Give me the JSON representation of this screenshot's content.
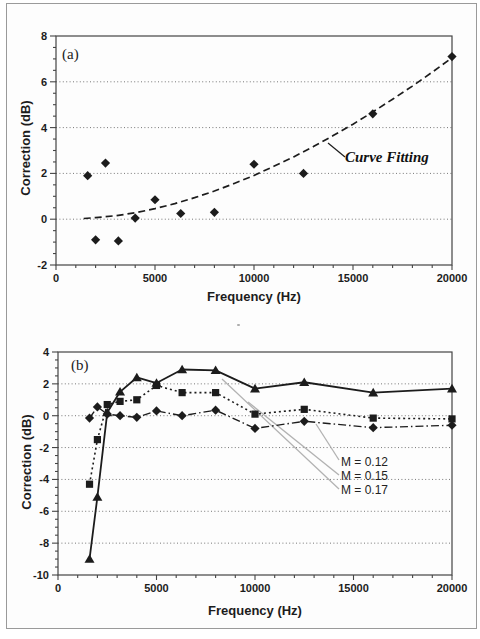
{
  "figure": {
    "panel_a_label": "(a)",
    "panel_b_label": "(b)"
  },
  "charts": [
    {
      "id": "chart-a",
      "type": "scatter",
      "panel_label": "(a)",
      "xlabel": "Frequency (Hz)",
      "ylabel": "Correction (dB)",
      "xlim": [
        0,
        20000
      ],
      "ylim": [
        -2,
        8
      ],
      "x_ticks": [
        0,
        5000,
        10000,
        15000,
        20000
      ],
      "y_ticks": [
        8,
        6,
        4,
        2,
        0,
        -2
      ],
      "grid_y": [
        0,
        2,
        4,
        6
      ],
      "grid": "dotted-horizontal",
      "series": [
        {
          "name": "measured-points",
          "marker": "diamond",
          "line": "none",
          "x": [
            1600,
            2000,
            2500,
            3150,
            4000,
            5000,
            6300,
            8000,
            10000,
            12500,
            16000,
            20000
          ],
          "y": [
            1.9,
            -0.9,
            2.45,
            -0.95,
            0.05,
            0.85,
            0.25,
            0.3,
            2.4,
            2.0,
            4.6,
            7.1
          ]
        },
        {
          "name": "curve-fit",
          "marker": "none",
          "line": "dashed",
          "x": [
            1400,
            2000,
            3000,
            4000,
            5000,
            6000,
            7000,
            8000,
            9000,
            10000,
            11000,
            12000,
            13000,
            14000,
            15000,
            16000,
            17000,
            18000,
            19000,
            20000
          ],
          "y": [
            0.03,
            0.07,
            0.15,
            0.28,
            0.46,
            0.68,
            0.94,
            1.23,
            1.56,
            1.91,
            2.31,
            2.72,
            3.17,
            3.65,
            4.15,
            4.68,
            5.24,
            5.81,
            6.42,
            7.05
          ]
        }
      ],
      "annotations": [
        {
          "text": "Curve Fitting"
        }
      ]
    },
    {
      "id": "chart-b",
      "type": "line",
      "panel_label": "(b)",
      "xlabel": "Frequency (Hz)",
      "ylabel": "Correction (dB)",
      "xlim": [
        0,
        20000
      ],
      "ylim": [
        -10,
        4
      ],
      "x_ticks": [
        0,
        5000,
        10000,
        15000,
        20000
      ],
      "y_ticks": [
        4,
        2,
        0,
        -2,
        -4,
        -6,
        -8,
        -10
      ],
      "grid_y": [
        2,
        0,
        -2,
        -4,
        -6,
        -8
      ],
      "grid": "dotted-horizontal",
      "x": [
        1600,
        2000,
        2500,
        3150,
        4000,
        5000,
        6300,
        8000,
        10000,
        12500,
        16000,
        20000
      ],
      "series": [
        {
          "name": "M = 0.12",
          "marker": "diamond",
          "line": "dashdot",
          "values": [
            -0.15,
            0.55,
            0.1,
            0.0,
            -0.1,
            0.3,
            0.0,
            0.35,
            -0.8,
            -0.35,
            -0.75,
            -0.6
          ]
        },
        {
          "name": "M = 0.15",
          "marker": "square",
          "line": "dotted",
          "values": [
            -4.3,
            -1.5,
            0.7,
            0.9,
            1.0,
            1.9,
            1.45,
            1.45,
            0.1,
            0.4,
            -0.15,
            -0.2
          ]
        },
        {
          "name": "M = 0.17",
          "marker": "triangle",
          "line": "solid",
          "values": [
            -9.0,
            -5.1,
            0.2,
            1.5,
            2.4,
            2.05,
            2.9,
            2.85,
            1.7,
            2.1,
            1.45,
            1.7
          ]
        }
      ],
      "annotations": [
        {
          "text": "M = 0.12"
        },
        {
          "text": "M = 0.15"
        },
        {
          "text": "M = 0.17"
        }
      ]
    }
  ],
  "colors": {
    "ink": "#1c1c1c",
    "grid": "#777777",
    "leader_gray": "#b2b2b2",
    "frame": "#444444"
  }
}
